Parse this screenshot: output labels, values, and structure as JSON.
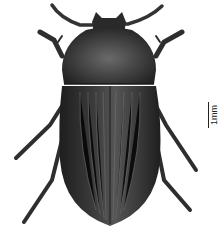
{
  "image": {
    "subject": "beetle specimen, dorsal view",
    "background_color": "#ffffff",
    "body_color": "#3a3a3a"
  },
  "scale_bar": {
    "label": "1mm"
  }
}
